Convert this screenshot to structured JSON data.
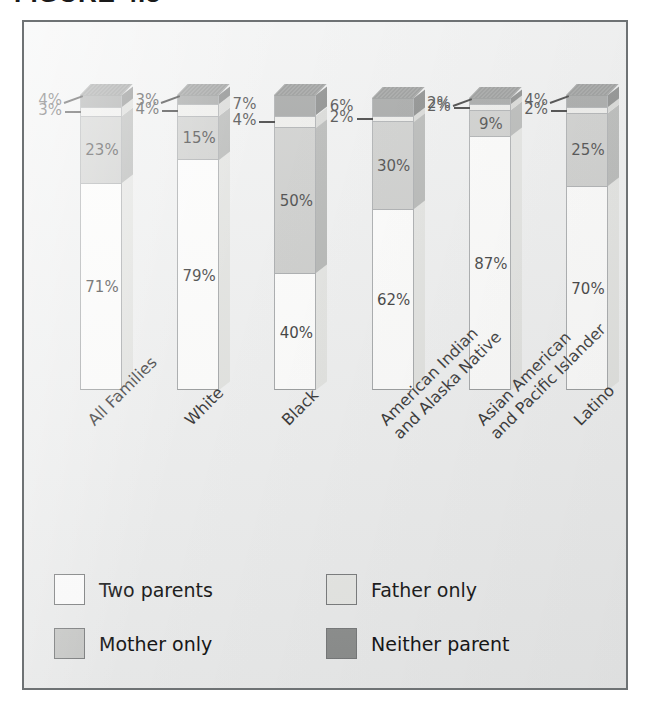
{
  "caption": {
    "figure_number": "FIGURE 4.3",
    "figure_title": "Where children live"
  },
  "chart_data": {
    "type": "bar",
    "subtype": "stacked-column-3d",
    "title": "",
    "xlabel": "",
    "ylabel": "",
    "ylim": [
      0,
      100
    ],
    "grid": false,
    "legend_position": "bottom-left",
    "value_suffix": "%",
    "categories": [
      "All Families",
      "White",
      "Black",
      "American Indian\nand Alaska Native",
      "Asian American\nand Pacific Islander",
      "Latino"
    ],
    "series": [
      {
        "name": "Two parents",
        "color": "#fdfdfc",
        "values": [
          71,
          79,
          40,
          62,
          87,
          70
        ]
      },
      {
        "name": "Mother only",
        "color": "#c3c4c2",
        "values": [
          23,
          15,
          50,
          30,
          9,
          25
        ]
      },
      {
        "name": "Father only",
        "color": "#e9e9e6",
        "values": [
          3,
          4,
          4,
          2,
          2,
          2
        ]
      },
      {
        "name": "Neither parent",
        "color": "#8e908f",
        "values": [
          4,
          3,
          7,
          6,
          2,
          4
        ]
      }
    ]
  },
  "bars": [
    {
      "category": "All Families",
      "label_line1": "All Families",
      "label_line2": "",
      "two_parents": "71%",
      "mother_only": "23%",
      "father_only": "3%",
      "neither_parent": "4%"
    },
    {
      "category": "White",
      "label_line1": "White",
      "label_line2": "",
      "two_parents": "79%",
      "mother_only": "15%",
      "father_only": "4%",
      "neither_parent": "3%"
    },
    {
      "category": "Black",
      "label_line1": "Black",
      "label_line2": "",
      "two_parents": "40%",
      "mother_only": "50%",
      "father_only": "4%",
      "neither_parent": "7%"
    },
    {
      "category": "American Indian and Alaska Native",
      "label_line1": "American Indian",
      "label_line2": "and Alaska Native",
      "two_parents": "62%",
      "mother_only": "30%",
      "father_only": "2%",
      "neither_parent": "6%"
    },
    {
      "category": "Asian American and Pacific Islander",
      "label_line1": "Asian American",
      "label_line2": "and Pacific Islander",
      "two_parents": "87%",
      "mother_only": "9%",
      "father_only": "2%",
      "neither_parent": "2%"
    },
    {
      "category": "Latino",
      "label_line1": "Latino",
      "label_line2": "",
      "two_parents": "70%",
      "mother_only": "25%",
      "father_only": "2%",
      "neither_parent": "4%"
    }
  ],
  "legend": {
    "items": [
      {
        "label": "Two parents",
        "swatch": "two-parents",
        "color": "#ffffff"
      },
      {
        "label": "Father only",
        "swatch": "father-only",
        "color": "#e8e9e6"
      },
      {
        "label": "Mother only",
        "swatch": "mother-only",
        "color": "#c7c8c6"
      },
      {
        "label": "Neither parent",
        "swatch": "neither",
        "color": "#8d8f8e"
      }
    ]
  },
  "style": {
    "frame_border": "#6e7274",
    "panel_background": "#edeeee"
  }
}
